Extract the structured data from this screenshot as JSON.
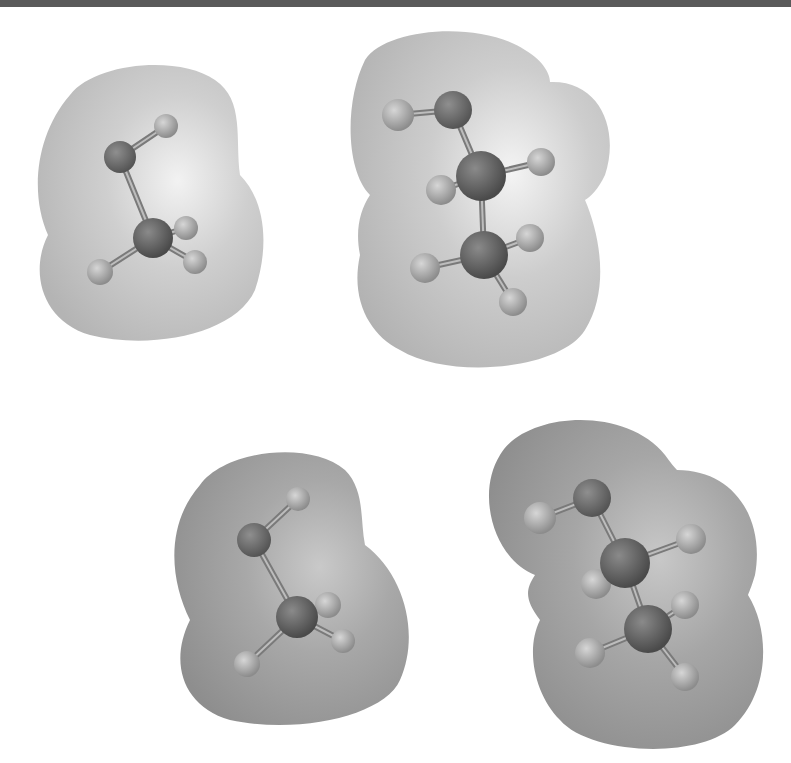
{
  "figure": {
    "top_bar_color": "#5a5a5a",
    "background": "#ffffff"
  },
  "molecules": [
    {
      "id": "methanol-light",
      "name": "methanol",
      "surface_shade": "light",
      "surface": {
        "fill": "#cfcfcf",
        "shadow": "#b4b4b4",
        "highlight": "#f2f2f2"
      },
      "surface_path": "M70,95 C95,62 180,55 215,80 C245,100 235,140 240,175 C265,200 270,245 255,290 C235,335 150,350 90,335 C40,320 30,270 48,235 C30,195 35,135 70,95 Z",
      "atoms": [
        {
          "el": "H",
          "x": 166,
          "y": 126,
          "r": 12
        },
        {
          "el": "O",
          "x": 120,
          "y": 157,
          "r": 16
        },
        {
          "el": "C",
          "x": 153,
          "y": 238,
          "r": 20
        },
        {
          "el": "H",
          "x": 186,
          "y": 228,
          "r": 12
        },
        {
          "el": "H",
          "x": 195,
          "y": 262,
          "r": 12
        },
        {
          "el": "H",
          "x": 100,
          "y": 272,
          "r": 13
        }
      ],
      "bonds": [
        [
          0,
          1
        ],
        [
          1,
          2
        ],
        [
          2,
          3
        ],
        [
          2,
          4
        ],
        [
          2,
          5
        ]
      ]
    },
    {
      "id": "ethanol-light",
      "name": "ethanol",
      "surface_shade": "light",
      "surface": {
        "fill": "#cdcdcd",
        "shadow": "#b2b2b2",
        "highlight": "#f4f4f4"
      },
      "surface_path": "M365,60 C385,28 480,20 525,50 C545,62 550,75 550,82 C600,80 620,130 605,175 C598,190 590,197 585,200 C600,235 610,290 585,330 C560,370 450,380 400,350 C370,335 350,300 360,255 C355,230 360,210 370,195 C345,170 345,100 365,60 Z",
      "atoms": [
        {
          "el": "H",
          "x": 398,
          "y": 115,
          "r": 16
        },
        {
          "el": "O",
          "x": 453,
          "y": 110,
          "r": 19
        },
        {
          "el": "C",
          "x": 481,
          "y": 176,
          "r": 25
        },
        {
          "el": "H",
          "x": 541,
          "y": 162,
          "r": 14
        },
        {
          "el": "H",
          "x": 441,
          "y": 190,
          "r": 15
        },
        {
          "el": "C",
          "x": 484,
          "y": 255,
          "r": 24
        },
        {
          "el": "H",
          "x": 530,
          "y": 238,
          "r": 14
        },
        {
          "el": "H",
          "x": 425,
          "y": 268,
          "r": 15
        },
        {
          "el": "H",
          "x": 513,
          "y": 302,
          "r": 14
        }
      ],
      "bonds": [
        [
          0,
          1
        ],
        [
          1,
          2
        ],
        [
          2,
          3
        ],
        [
          2,
          4
        ],
        [
          2,
          5
        ],
        [
          5,
          6
        ],
        [
          5,
          7
        ],
        [
          5,
          8
        ]
      ]
    },
    {
      "id": "methanol-dark",
      "name": "methanol",
      "surface_shade": "dark",
      "surface": {
        "fill": "#a8a8a8",
        "shadow": "#8e8e8e",
        "highlight": "#c9c9c9"
      },
      "surface_path": "M200,485 C225,450 310,440 345,470 C365,490 360,520 365,545 C405,575 420,635 400,680 C385,715 300,735 230,720 C180,705 170,660 190,620 C170,580 165,525 200,485 Z",
      "atoms": [
        {
          "el": "H",
          "x": 298,
          "y": 499,
          "r": 12
        },
        {
          "el": "O",
          "x": 254,
          "y": 540,
          "r": 17
        },
        {
          "el": "C",
          "x": 297,
          "y": 617,
          "r": 21
        },
        {
          "el": "H",
          "x": 328,
          "y": 605,
          "r": 13
        },
        {
          "el": "H",
          "x": 343,
          "y": 641,
          "r": 12
        },
        {
          "el": "H",
          "x": 247,
          "y": 664,
          "r": 13
        }
      ],
      "bonds": [
        [
          0,
          1
        ],
        [
          1,
          2
        ],
        [
          2,
          3
        ],
        [
          2,
          4
        ],
        [
          2,
          5
        ]
      ]
    },
    {
      "id": "ethanol-dark",
      "name": "ethanol",
      "surface_shade": "dark",
      "surface": {
        "fill": "#a6a6a6",
        "shadow": "#8b8b8b",
        "highlight": "#c8c8c8"
      },
      "surface_path": "M500,455 C525,412 625,405 665,455 C670,462 675,468 677,470 C735,470 765,520 755,575 C752,585 750,590 748,595 C770,630 770,690 735,725 C700,760 590,755 560,720 C535,695 525,650 540,620 C525,600 525,590 535,575 C495,560 475,495 500,455 Z",
      "atoms": [
        {
          "el": "H",
          "x": 540,
          "y": 518,
          "r": 16
        },
        {
          "el": "O",
          "x": 592,
          "y": 498,
          "r": 19
        },
        {
          "el": "C",
          "x": 625,
          "y": 563,
          "r": 25
        },
        {
          "el": "H",
          "x": 691,
          "y": 539,
          "r": 15
        },
        {
          "el": "H",
          "x": 596,
          "y": 584,
          "r": 15
        },
        {
          "el": "C",
          "x": 648,
          "y": 629,
          "r": 24
        },
        {
          "el": "H",
          "x": 685,
          "y": 605,
          "r": 14
        },
        {
          "el": "H",
          "x": 590,
          "y": 653,
          "r": 15
        },
        {
          "el": "H",
          "x": 685,
          "y": 677,
          "r": 14
        }
      ],
      "bonds": [
        [
          0,
          1
        ],
        [
          1,
          2
        ],
        [
          2,
          3
        ],
        [
          2,
          4
        ],
        [
          2,
          5
        ],
        [
          5,
          6
        ],
        [
          5,
          7
        ],
        [
          5,
          8
        ]
      ]
    }
  ],
  "atom_colors": {
    "C": {
      "base": "#4a4a4a",
      "light": "#8a8a8a"
    },
    "O": {
      "base": "#555555",
      "light": "#8f8f8f"
    },
    "H": {
      "base": "#8c8c8c",
      "light": "#d6d6d6"
    }
  },
  "bond_color": "#7a7a7a"
}
